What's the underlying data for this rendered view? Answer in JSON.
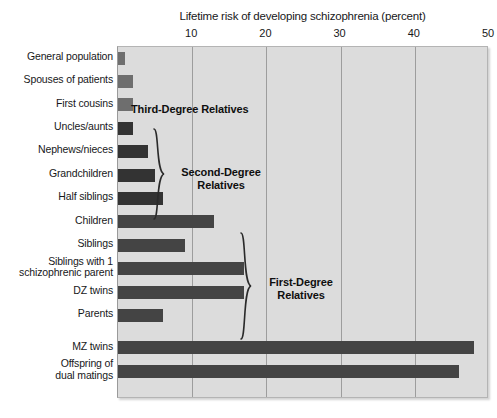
{
  "chart_data": {
    "type": "bar",
    "orientation": "horizontal",
    "title": "Lifetime risk of developing schizophrenia (percent)",
    "xlabel": "Lifetime risk of developing schizophrenia (percent)",
    "ylabel": "",
    "xlim": [
      0,
      50
    ],
    "xticks": [
      10,
      20,
      30,
      40,
      50
    ],
    "xticklabels": [
      "10",
      "20",
      "30",
      "40",
      "50"
    ],
    "grid": true,
    "legend": false,
    "categories": [
      "General population",
      "Spouses of patients",
      "First cousins",
      "Uncles/aunts",
      "Nephews/nieces",
      "Grandchildren",
      "Half siblings",
      "Children",
      "Siblings",
      "Siblings with 1\nschizophrenic parent",
      "DZ twins",
      "Parents",
      "MZ twins",
      "Offspring of\ndual matings"
    ],
    "values": [
      1,
      2,
      2,
      2,
      4,
      5,
      6,
      13,
      9,
      17,
      17,
      6,
      48,
      46
    ],
    "bar_colors": [
      "#6e6e6e",
      "#6e6e6e",
      "#6e6e6e",
      "#333333",
      "#333333",
      "#333333",
      "#333333",
      "#444444",
      "#444444",
      "#444444",
      "#444444",
      "#444444",
      "#444444",
      "#444444"
    ],
    "annotations": [
      {
        "text": "Third-Degree Relatives",
        "relates_to": [
          "First cousins"
        ]
      },
      {
        "text": "Second-Degree\nRelatives",
        "relates_to": [
          "Uncles/aunts",
          "Nephews/nieces",
          "Grandchildren",
          "Half siblings"
        ]
      },
      {
        "text": "First-Degree\nRelatives",
        "relates_to": [
          "Children",
          "Siblings",
          "Siblings with 1 schizophrenic parent",
          "DZ twins",
          "Parents"
        ]
      }
    ],
    "plot_background": "#dcdcdc",
    "gridline_color": "#9d9d9d"
  },
  "groups": {
    "third_degree": {
      "label": "Third-Degree Relatives"
    },
    "second_degree": {
      "label": "Second-Degree\nRelatives"
    },
    "first_degree": {
      "label": "First-Degree\nRelatives"
    }
  }
}
